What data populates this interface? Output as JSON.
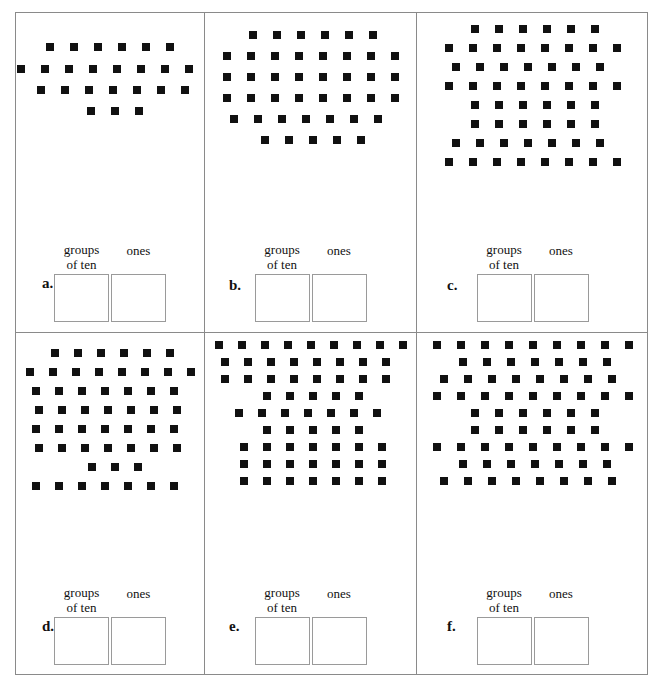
{
  "worksheet": {
    "tens_label_line1": "groups",
    "tens_label_line2": "of ten",
    "ones_label": "ones",
    "border_color": "#8a8a8a",
    "dot_color": "#111111",
    "box_border_color": "#9a9a9a"
  },
  "panels": [
    {
      "letter": "a.",
      "total_dots": 24,
      "rows": [
        6,
        8,
        7,
        3
      ],
      "row_offsets": [
        0,
        2,
        5,
        1
      ],
      "row_gaps": [
        14,
        13,
        13,
        13
      ],
      "top_pad": 30,
      "dot_gap": 16,
      "tens_answer": "",
      "ones_answer": ""
    },
    {
      "letter": "b.",
      "total_dots": 42,
      "rows": [
        6,
        8,
        8,
        8,
        7,
        5
      ],
      "row_offsets": [
        5,
        0,
        0,
        0,
        2,
        5
      ],
      "row_gaps": [
        13,
        13,
        13,
        13,
        13,
        13
      ],
      "top_pad": 18,
      "dot_gap": 16,
      "tens_answer": "",
      "ones_answer": ""
    },
    {
      "letter": "c.",
      "total_dots": 56,
      "rows": [
        6,
        8,
        7,
        8,
        6,
        6,
        7,
        8
      ],
      "row_offsets": [
        5,
        0,
        2,
        0,
        5,
        5,
        2,
        0
      ],
      "row_gaps": [
        11,
        11,
        11,
        11,
        11,
        11,
        11,
        11
      ],
      "top_pad": 12,
      "dot_gap": 16,
      "tens_answer": "",
      "ones_answer": ""
    },
    {
      "letter": "d.",
      "total_dots": 52,
      "rows": [
        6,
        8,
        7,
        7,
        7,
        7,
        3,
        7
      ],
      "row_offsets": [
        5,
        0,
        2,
        6,
        2,
        6,
        1,
        2
      ],
      "row_gaps": [
        11,
        11,
        11,
        11,
        11,
        11,
        11,
        11
      ],
      "top_pad": 16,
      "dot_gap": 15,
      "tens_answer": "",
      "ones_answer": ""
    },
    {
      "letter": "e.",
      "total_dots": 63,
      "rows": [
        9,
        8,
        8,
        5,
        7,
        5,
        7,
        7,
        7
      ],
      "row_offsets": [
        0,
        2,
        2,
        5,
        6,
        5,
        5,
        5,
        5
      ],
      "row_gaps": [
        9,
        9,
        9,
        9,
        9,
        9,
        9,
        9,
        9
      ],
      "top_pad": 8,
      "dot_gap": 15,
      "tens_answer": "",
      "ones_answer": ""
    },
    {
      "letter": "f.",
      "total_dots": 69,
      "rows": [
        9,
        7,
        8,
        9,
        6,
        6,
        9,
        7,
        8
      ],
      "row_offsets": [
        0,
        5,
        2,
        0,
        5,
        5,
        0,
        5,
        2
      ],
      "row_gaps": [
        9,
        9,
        9,
        9,
        9,
        9,
        9,
        9,
        9
      ],
      "top_pad": 8,
      "dot_gap": 16,
      "tens_answer": "",
      "ones_answer": ""
    }
  ]
}
